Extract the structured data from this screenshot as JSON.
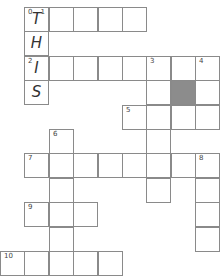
{
  "puzzle": {
    "cell_size": 24.4,
    "origin": {
      "x": 0,
      "y": 7
    },
    "colors": {
      "border": "#8a8a8a",
      "shaded": "#8c8c8c",
      "fill": "#ffffff"
    },
    "cells": [
      {
        "r": 0,
        "c": 1,
        "num": "0",
        "num2": "1",
        "letter": "T"
      },
      {
        "r": 0,
        "c": 2
      },
      {
        "r": 0,
        "c": 3
      },
      {
        "r": 0,
        "c": 4
      },
      {
        "r": 0,
        "c": 5
      },
      {
        "r": 1,
        "c": 1,
        "letter": "H"
      },
      {
        "r": 2,
        "c": 1,
        "num": "2",
        "letter": "I"
      },
      {
        "r": 2,
        "c": 2
      },
      {
        "r": 2,
        "c": 3
      },
      {
        "r": 2,
        "c": 4
      },
      {
        "r": 2,
        "c": 5
      },
      {
        "r": 2,
        "c": 6,
        "num": "3"
      },
      {
        "r": 2,
        "c": 7
      },
      {
        "r": 2,
        "c": 8,
        "num": "4"
      },
      {
        "r": 3,
        "c": 1,
        "letter": "S"
      },
      {
        "r": 3,
        "c": 6
      },
      {
        "r": 3,
        "c": 7,
        "shaded": true
      },
      {
        "r": 3,
        "c": 8
      },
      {
        "r": 4,
        "c": 5,
        "num": "5"
      },
      {
        "r": 4,
        "c": 6
      },
      {
        "r": 4,
        "c": 7
      },
      {
        "r": 4,
        "c": 8
      },
      {
        "r": 5,
        "c": 2,
        "num": "6"
      },
      {
        "r": 5,
        "c": 6
      },
      {
        "r": 6,
        "c": 1,
        "num": "7"
      },
      {
        "r": 6,
        "c": 2
      },
      {
        "r": 6,
        "c": 3
      },
      {
        "r": 6,
        "c": 4
      },
      {
        "r": 6,
        "c": 5
      },
      {
        "r": 6,
        "c": 6
      },
      {
        "r": 6,
        "c": 7
      },
      {
        "r": 6,
        "c": 8,
        "num": "8"
      },
      {
        "r": 7,
        "c": 2
      },
      {
        "r": 7,
        "c": 6
      },
      {
        "r": 7,
        "c": 8
      },
      {
        "r": 8,
        "c": 1,
        "num": "9"
      },
      {
        "r": 8,
        "c": 2
      },
      {
        "r": 8,
        "c": 3
      },
      {
        "r": 8,
        "c": 8
      },
      {
        "r": 9,
        "c": 2
      },
      {
        "r": 9,
        "c": 8
      },
      {
        "r": 10,
        "c": 0,
        "num": "10"
      },
      {
        "r": 10,
        "c": 1
      },
      {
        "r": 10,
        "c": 2
      },
      {
        "r": 10,
        "c": 3
      },
      {
        "r": 10,
        "c": 4
      }
    ]
  }
}
